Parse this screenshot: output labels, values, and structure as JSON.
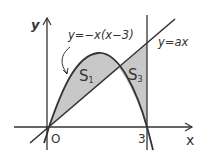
{
  "labels": {
    "y_axis": "y",
    "x_axis": "x",
    "origin": "O",
    "x_tick": "3",
    "parabola": "y=−x(x−3)",
    "line": "y=ax",
    "region1": "S",
    "region1_sub": "1",
    "region3": "S",
    "region3_sub": "3"
  },
  "colors": {
    "stroke": "#333333",
    "shade": "#c8c8c8",
    "background": "#ffffff"
  }
}
